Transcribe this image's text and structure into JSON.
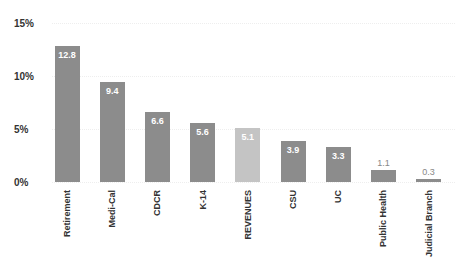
{
  "chart_data": {
    "type": "bar",
    "title": "",
    "xlabel": "",
    "ylabel": "",
    "ylim": [
      0,
      15
    ],
    "yticks": [
      "0%",
      "5%",
      "10%",
      "15%"
    ],
    "grid": true,
    "categories": [
      "Retirement",
      "Medi-Cal",
      "CDCR",
      "K-14",
      "REVENUES",
      "CSU",
      "UC",
      "Public Health",
      "Judicial Branch"
    ],
    "values": [
      12.8,
      9.4,
      6.6,
      5.6,
      5.1,
      3.9,
      3.3,
      1.1,
      0.3
    ],
    "value_labels": [
      "12.8",
      "9.4",
      "6.6",
      "5.6",
      "5.1",
      "3.9",
      "3.3",
      "1.1",
      "0.3"
    ],
    "colors": [
      "#8c8c8c",
      "#8c8c8c",
      "#8c8c8c",
      "#8c8c8c",
      "#c4c4c4",
      "#8c8c8c",
      "#8c8c8c",
      "#8c8c8c",
      "#8c8c8c"
    ]
  }
}
